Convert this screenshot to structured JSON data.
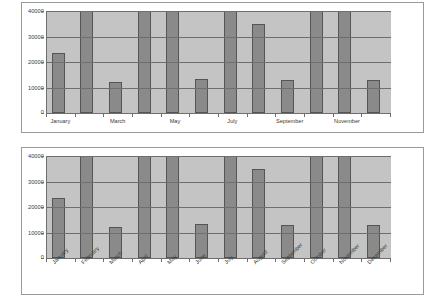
{
  "chart_data": [
    {
      "type": "bar",
      "title": "",
      "xlabel": "",
      "ylabel": "",
      "ylim": [
        0,
        40000
      ],
      "yticks": [
        0,
        10000,
        20000,
        30000,
        40000
      ],
      "ytick_labels": [
        "0",
        "10000",
        "20000",
        "30000",
        "40000"
      ],
      "grid": true,
      "legend": "none",
      "axis_label_rotation": 0,
      "visible_tick_labels": [
        "January",
        "March",
        "May",
        "July",
        "September",
        "November"
      ],
      "categories": [
        "January",
        "February",
        "March",
        "April",
        "May",
        "June",
        "July",
        "August",
        "September",
        "October",
        "November",
        "December"
      ],
      "values": [
        23500,
        43000,
        12300,
        43000,
        43000,
        13300,
        43000,
        35000,
        12800,
        43000,
        43000,
        12800
      ],
      "clipped_at_top": [
        false,
        true,
        false,
        true,
        true,
        false,
        true,
        false,
        false,
        true,
        true,
        false
      ],
      "bar_fill": "#8a8a8a",
      "bar_border": "#555555",
      "plot_background": "#c4c4c4",
      "gridline_color": "#6e6e6e"
    },
    {
      "type": "bar",
      "title": "",
      "xlabel": "",
      "ylabel": "",
      "ylim": [
        0,
        40000
      ],
      "yticks": [
        0,
        10000,
        20000,
        30000,
        40000
      ],
      "ytick_labels": [
        "0",
        "10000",
        "20000",
        "30000",
        "40000"
      ],
      "grid": true,
      "legend": "none",
      "axis_label_rotation": -45,
      "visible_tick_labels": [
        "January",
        "February",
        "March",
        "April",
        "May",
        "June",
        "July",
        "August",
        "September",
        "October",
        "November",
        "December"
      ],
      "categories": [
        "January",
        "February",
        "March",
        "April",
        "May",
        "June",
        "July",
        "August",
        "September",
        "October",
        "November",
        "December"
      ],
      "values": [
        23500,
        43000,
        12300,
        43000,
        43000,
        13300,
        43000,
        35000,
        12800,
        43000,
        43000,
        12800
      ],
      "clipped_at_top": [
        false,
        true,
        false,
        true,
        true,
        false,
        true,
        false,
        false,
        true,
        true,
        false
      ],
      "bar_fill": "#8a8a8a",
      "bar_border": "#555555",
      "plot_background": "#c4c4c4",
      "gridline_color": "#6e6e6e"
    }
  ]
}
